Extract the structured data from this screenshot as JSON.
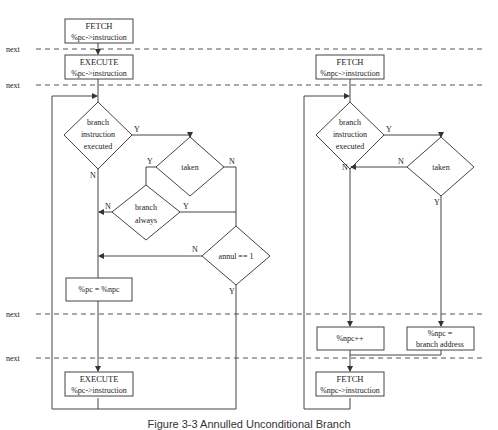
{
  "timeline": {
    "label": "next",
    "lines_y": [
      49,
      85,
      314,
      358
    ]
  },
  "left_flow": {
    "fetch_box": {
      "title": "FETCH",
      "sub": "%pc->instruction"
    },
    "execute_box": {
      "title": "EXECUTE",
      "sub": "%pc->instruction"
    },
    "decision_branch": {
      "line1": "branch",
      "line2": "instruction",
      "line3": "executed",
      "yes": "Y",
      "no": "N"
    },
    "decision_taken": {
      "label": "taken",
      "yes": "Y",
      "no": "N"
    },
    "decision_always": {
      "line1": "branch",
      "line2": "always",
      "yes": "Y",
      "no": "N"
    },
    "decision_annul": {
      "label": "annul == 1",
      "yes": "Y",
      "no": "N"
    },
    "assign_box": {
      "label": "%pc = %npc"
    },
    "execute_box_2": {
      "title": "EXECUTE",
      "sub": "%pc->instruction"
    }
  },
  "right_flow": {
    "fetch_box": {
      "title": "FETCH",
      "sub": "%npc->instruction"
    },
    "decision_branch": {
      "line1": "branch",
      "line2": "instruction",
      "line3": "executed",
      "yes": "Y",
      "no": "N"
    },
    "decision_taken": {
      "label": "taken",
      "yes": "Y",
      "no": "N"
    },
    "increment_box": {
      "label": "%npc++"
    },
    "branch_addr_box": {
      "line1": "%npc =",
      "line2": "branch address"
    },
    "fetch_box_2": {
      "title": "FETCH",
      "sub": "%npc->instruction"
    }
  },
  "caption": "Figure 3-3  Annulled Unconditional Branch"
}
